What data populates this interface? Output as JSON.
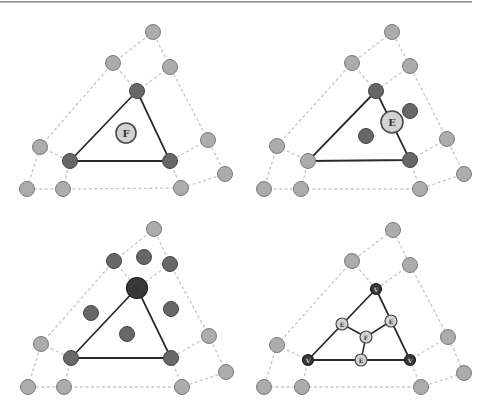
{
  "figure": {
    "colors": {
      "light_node": "#acacac",
      "dark_node": "#676767",
      "very_dark_node": "#383838",
      "label_node": "#d2d2d2",
      "dashed_edge": "#c6c6c6",
      "solid_edge": "#2a2a2a"
    },
    "panels": [
      {
        "id": "face",
        "label": "F"
      },
      {
        "id": "edge",
        "label": "E"
      },
      {
        "id": "vertex",
        "label": "V"
      },
      {
        "id": "result",
        "labels": {
          "v1": "V",
          "v2": "V",
          "v3": "V",
          "e1": "E",
          "e2": "E",
          "e3": "E",
          "f": "F"
        }
      }
    ]
  }
}
